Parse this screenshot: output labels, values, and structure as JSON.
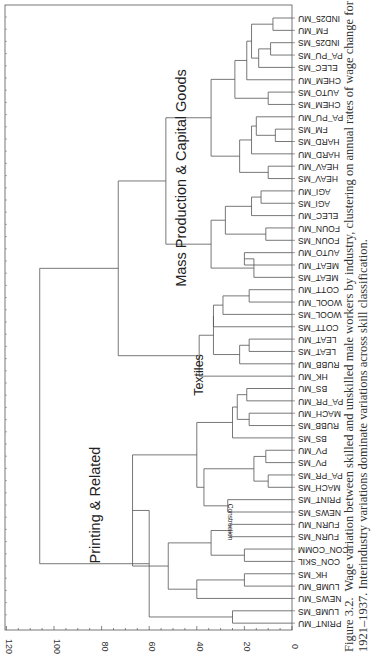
{
  "chart_data": {
    "type": "dendrogram",
    "orientation": "rotated 90 degrees; distance axis along bottom, leaves along right edge",
    "title": "",
    "xlabel": "",
    "ylabel": "",
    "axis": {
      "ticks": [
        0,
        20,
        40,
        60,
        80,
        100,
        120
      ],
      "range": [
        0,
        120
      ]
    },
    "leaves": [
      "IND25_MU",
      "FM_MU",
      "IND25_MS",
      "PA_PU_MS",
      "ELEC_MS",
      "CHEM_MU",
      "AUTO_MS",
      "CHEM_MS",
      "PA_PU_MU",
      "FM_MS",
      "HARD_MS",
      "HARD_MU",
      "HEAV_MU",
      "HEAV_MS",
      "AGI_MU",
      "AGI_MS",
      "ELEC_MU",
      "FOUN_MU",
      "FOUN_MS",
      "AUTO_MU",
      "MEAT_MU",
      "MEAT_MS",
      "COTT_MU",
      "WOOL_MU",
      "WOOL_MS",
      "COTT_MS",
      "LEAT_MU",
      "LEAT_MS",
      "RUBB_MU",
      "HK_MU",
      "BS_MU",
      "PA_PR_MU",
      "MACH_MU",
      "RUBB_MS",
      "BS_MS",
      "PV_MU",
      "PV_MS",
      "PA_PR_MS",
      "MACH_MS",
      "PRINT_MS",
      "NEWS_MS",
      "FURN_MU",
      "FURN_MS",
      "CON_COMM",
      "CON_SKIL",
      "HK_MS",
      "LUMB_MU",
      "NEWS_MU",
      "LUMB_MS",
      "PRINT_MU"
    ],
    "merges": [
      {
        "a": [
          0,
          1
        ],
        "h": 8
      },
      {
        "a": [
          2,
          3
        ],
        "h": 9
      },
      {
        "a": [
          "m1",
          4
        ],
        "h": 14
      },
      {
        "a": [
          "m0",
          "m2"
        ],
        "h": 17
      },
      {
        "a": [
          "m3",
          5
        ],
        "h": 19
      },
      {
        "a": [
          6,
          7
        ],
        "h": 10
      },
      {
        "a": [
          "m4",
          "m5"
        ],
        "h": 24
      },
      {
        "a": [
          9,
          10
        ],
        "h": 7
      },
      {
        "a": [
          8,
          "m7"
        ],
        "h": 15
      },
      {
        "a": [
          "m8",
          11
        ],
        "h": 17
      },
      {
        "a": [
          12,
          13
        ],
        "h": 10
      },
      {
        "a": [
          "m9",
          "m10"
        ],
        "h": 22
      },
      {
        "a": [
          "m6",
          "m11"
        ],
        "h": 34
      },
      {
        "a": [
          14,
          15
        ],
        "h": 13
      },
      {
        "a": [
          "m13",
          16
        ],
        "h": 17
      },
      {
        "a": [
          17,
          18
        ],
        "h": 11
      },
      {
        "a": [
          "m14",
          "m15"
        ],
        "h": 28
      },
      {
        "a": [
          19,
          20
        ],
        "h": 20
      },
      {
        "a": [
          "m17",
          21
        ],
        "h": 16
      },
      {
        "a": [
          "m16",
          "m18"
        ],
        "h": 34
      },
      {
        "a": [
          "m12",
          "m19"
        ],
        "h": 53
      },
      {
        "a": [
          22,
          23
        ],
        "h": 18
      },
      {
        "a": [
          "m21",
          24
        ],
        "h": 29
      },
      {
        "a": [
          "m22",
          25
        ],
        "h": 33
      },
      {
        "a": [
          26,
          27
        ],
        "h": 18
      },
      {
        "a": [
          "m24",
          28
        ],
        "h": 22
      },
      {
        "a": [
          "m23",
          "m25"
        ],
        "h": 33
      },
      {
        "a": [
          "m26",
          29
        ],
        "h": 39
      },
      {
        "a": [
          "m20",
          "m27"
        ],
        "h": 73
      },
      {
        "a": [
          30,
          31
        ],
        "h": 19
      },
      {
        "a": [
          32,
          33
        ],
        "h": 18
      },
      {
        "a": [
          "m29",
          "m30"
        ],
        "h": 23
      },
      {
        "a": [
          "m31",
          34
        ],
        "h": 25
      },
      {
        "a": [
          35,
          36
        ],
        "h": 11
      },
      {
        "a": [
          37,
          38
        ],
        "h": 10
      },
      {
        "a": [
          "m33",
          "m34"
        ],
        "h": 16
      },
      {
        "a": [
          39,
          40
        ],
        "h": 27
      },
      {
        "a": [
          "m35",
          "m36"
        ],
        "h": 37
      },
      {
        "a": [
          "m32",
          "m37"
        ],
        "h": 40
      },
      {
        "a": [
          41,
          42
        ],
        "h": 26
      },
      {
        "a": [
          43,
          44
        ],
        "h": 20
      },
      {
        "a": [
          "m39",
          "m40"
        ],
        "h": 34
      },
      {
        "a": [
          45,
          46
        ],
        "h": 20
      },
      {
        "a": [
          "m42",
          47
        ],
        "h": 40
      },
      {
        "a": [
          "m41",
          "m43"
        ],
        "h": 52
      },
      {
        "a": [
          "m38",
          "m44"
        ],
        "h": 67
      },
      {
        "a": [
          48,
          49
        ],
        "h": 25
      },
      {
        "a": [
          "m45",
          "m46"
        ],
        "h": 60
      },
      {
        "a": [
          "m28",
          "m47"
        ],
        "h": 106
      }
    ],
    "cluster_annotations": [
      {
        "label": "Mass Production & Capital Goods"
      },
      {
        "label": "Textiles"
      },
      {
        "label": "Printing & Related"
      },
      {
        "label": "Construction"
      }
    ]
  },
  "figure": {
    "number": "Figure 3.2.",
    "caption_line1": "Wage variation between skilled and unskilled male workers by industry, clustering on annual rates of wage change for",
    "caption_line2": "1921–1937. Interindustry variations dominate variations across skill classification."
  }
}
